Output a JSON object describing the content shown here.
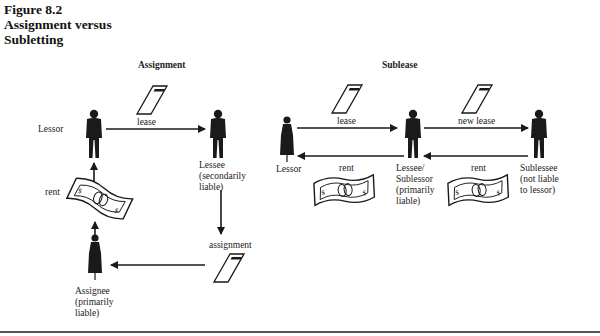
{
  "figure": {
    "number": "Figure 8.2",
    "title_line1": "Assignment versus",
    "title_line2": "Subletting"
  },
  "assignment": {
    "title": "Assignment",
    "lessor_label": "Lessor",
    "lease_label": "lease",
    "lease_doc_text": "LEASE",
    "lessee_label": "Lessee\n(secondarily\nliable)",
    "rent_label": "rent",
    "assignment_label": "assignment",
    "assignee_label": "Assignee\n(primarily\nliable)"
  },
  "sublease": {
    "title": "Sublease",
    "lessor_label": "Lessor",
    "lease_label": "lease",
    "new_lease_label": "new lease",
    "rent_label_left": "rent",
    "rent_label_right": "rent",
    "lessee_label": "Lessee/\nSublessor\n(primarily\nliable)",
    "sublessee_label": "Sublessee\n(not liable\nto lessor)"
  },
  "colors": {
    "ink": "#1a1a1a",
    "rule": "#555555",
    "background": "#ffffff"
  }
}
